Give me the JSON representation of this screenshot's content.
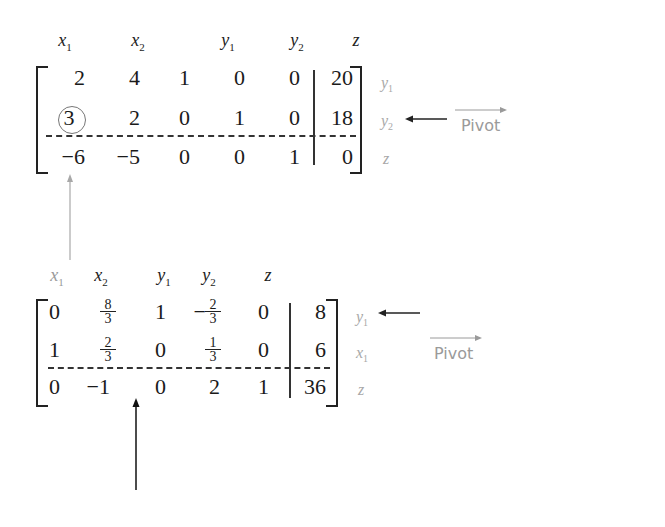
{
  "tableau1": {
    "column_headers": [
      "x1",
      "x2",
      "y1",
      "y2",
      "z"
    ],
    "rows": [
      {
        "values": [
          "2",
          "4",
          "1",
          "0",
          "0"
        ],
        "rhs": "20",
        "label": "y1"
      },
      {
        "values": [
          "3",
          "2",
          "0",
          "1",
          "0"
        ],
        "rhs": "18",
        "label": "y2"
      },
      {
        "values": [
          "−6",
          "−5",
          "0",
          "0",
          "1"
        ],
        "rhs": "0",
        "label": "z"
      }
    ],
    "pivot_element": "3",
    "pivot_label": "Pivot"
  },
  "tableau2": {
    "column_headers": [
      "x1",
      "x2",
      "y1",
      "y2",
      "z"
    ],
    "rows": [
      {
        "values": [
          "0",
          "8/3",
          "1",
          "−2/3",
          "0"
        ],
        "rhs": "8",
        "label": "y1"
      },
      {
        "values": [
          "1",
          "2/3",
          "0",
          "1/3",
          "0"
        ],
        "rhs": "6",
        "label": "x1"
      },
      {
        "values": [
          "0",
          "−1",
          "0",
          "2",
          "1"
        ],
        "rhs": "36",
        "label": "z"
      }
    ],
    "pivot_label": "Pivot"
  },
  "text": {
    "t1": {
      "h_x": "x",
      "h_y": "y",
      "h_z": "z",
      "s1": "1",
      "s2": "2",
      "r0": [
        "2",
        "4",
        "1",
        "0",
        "0",
        "20"
      ],
      "r1": [
        "3",
        "2",
        "0",
        "1",
        "0",
        "18"
      ],
      "r2": [
        "−6",
        "−5",
        "0",
        "0",
        "1",
        "0"
      ],
      "pivot": "Pivot"
    },
    "t2": {
      "r0a": "0",
      "r0c": "1",
      "r0neg": "−",
      "r0e": "0",
      "r0f": "8",
      "r1a": "1",
      "r1c": "0",
      "r1e": "0",
      "r1f": "6",
      "r2": [
        "0",
        "−1",
        "0",
        "2",
        "1",
        "36"
      ],
      "f8": "8",
      "f3": "3",
      "f2": "2",
      "f1": "1",
      "pivot": "Pivot"
    }
  }
}
